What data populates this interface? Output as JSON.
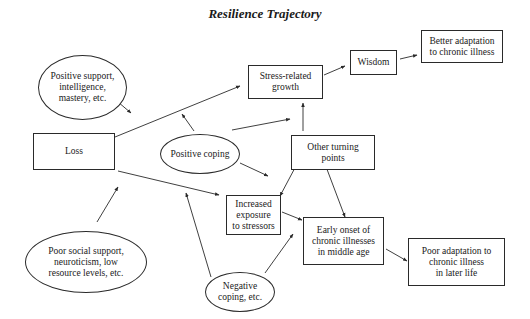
{
  "title": "Resilience Trajectory",
  "nodes": {
    "positive_support": {
      "shape": "ellipse",
      "label": "Positive support,\nintelligence,\nmastery, etc."
    },
    "loss": {
      "shape": "box",
      "label": "Loss"
    },
    "stress_related_growth": {
      "shape": "box",
      "label": "Stress-related\ngrowth"
    },
    "wisdom": {
      "shape": "box",
      "label": "Wisdom"
    },
    "better_adaptation": {
      "shape": "box",
      "label": "Better adaptation\nto chronic illness"
    },
    "positive_coping": {
      "shape": "ellipse",
      "label": "Positive coping"
    },
    "other_turning_points": {
      "shape": "box",
      "label": "Other turning\npoints"
    },
    "increased_exposure": {
      "shape": "box",
      "label": "Increased\nexposure\nto stressors"
    },
    "early_onset": {
      "shape": "box",
      "label": "Early onset of\nchronic illnesses\nin middle age"
    },
    "poor_adaptation": {
      "shape": "box",
      "label": "Poor adaptation to\nchronic illness\nin later life"
    },
    "poor_social_support": {
      "shape": "ellipse",
      "label": "Poor social support,\nneuroticism, low\nresource levels, etc."
    },
    "negative_coping": {
      "shape": "ellipse",
      "label": "Negative\ncoping, etc."
    }
  },
  "edges": [
    {
      "from": "loss",
      "to": "stress_related_growth",
      "type": "directed"
    },
    {
      "from": "loss",
      "to": "increased_exposure",
      "type": "directed"
    },
    {
      "from": "positive_support",
      "to": "loss_to_growth_path",
      "type": "moderating"
    },
    {
      "from": "positive_coping",
      "to": "loss_to_growth_path",
      "type": "moderating"
    },
    {
      "from": "positive_coping",
      "to": "stress_related_growth",
      "type": "directed"
    },
    {
      "from": "positive_coping",
      "to": "increased_exposure_to_turning_points_path",
      "type": "moderating"
    },
    {
      "from": "poor_social_support",
      "to": "loss_to_exposure_path",
      "type": "moderating"
    },
    {
      "from": "negative_coping",
      "to": "loss_to_exposure_path",
      "type": "moderating"
    },
    {
      "from": "negative_coping",
      "to": "exposure_to_early_onset_path",
      "type": "moderating"
    },
    {
      "from": "stress_related_growth",
      "to": "wisdom",
      "type": "directed"
    },
    {
      "from": "wisdom",
      "to": "better_adaptation",
      "type": "directed"
    },
    {
      "from": "other_turning_points",
      "to": "stress_related_growth",
      "type": "directed"
    },
    {
      "from": "increased_exposure",
      "to": "other_turning_points",
      "type": "bidirectional"
    },
    {
      "from": "other_turning_points",
      "to": "early_onset",
      "type": "bidirectional"
    },
    {
      "from": "increased_exposure",
      "to": "early_onset",
      "type": "directed"
    },
    {
      "from": "early_onset",
      "to": "poor_adaptation",
      "type": "directed"
    }
  ],
  "colors": {
    "line": "#2a2a2a",
    "background": "#ffffff"
  }
}
